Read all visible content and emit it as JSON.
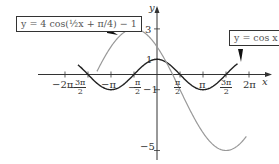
{
  "chart_data": {
    "type": "line",
    "title": "",
    "xlabel": "x",
    "ylabel": "y",
    "xlim": [
      -6.6,
      6.9
    ],
    "ylim": [
      -5.4,
      3.6
    ],
    "grid": false,
    "x_tick_labels": [
      "−2π",
      "−3π/2",
      "−π",
      "−π/2",
      "π/2",
      "π",
      "3π/2",
      "2π"
    ],
    "y_tick_labels": [
      "3",
      "1",
      "−1",
      "−5"
    ],
    "series": [
      {
        "name": "y = cos x",
        "expr": "cos(x)",
        "color": "#222222",
        "label": "y = cos x"
      },
      {
        "name": "y = 4 cos(1/2 x + π/4) − 1",
        "expr": "4*cos(x/2 + pi/4) - 1",
        "color": "#999999",
        "label": "y = 4 cos(½x + π/4) − 1"
      }
    ],
    "annotations": [
      {
        "text": "y = 4 cos(½x + π/4) − 1",
        "position": "upper-left box with pointer"
      },
      {
        "text": "y = cos x",
        "position": "upper-right box with pointer"
      }
    ]
  },
  "axes": {
    "x_label": "x",
    "y_label": "y"
  },
  "ticks": {
    "x": [
      {
        "label": "−2π",
        "value": -6.2832
      },
      {
        "num": "3π",
        "den": "2",
        "sign": "−",
        "value": -4.7124
      },
      {
        "label": "−π",
        "value": -3.1416
      },
      {
        "num": "π",
        "den": "2",
        "sign": "−",
        "value": -1.5708
      },
      {
        "num": "π",
        "den": "2",
        "sign": "",
        "value": 1.5708
      },
      {
        "label": "π",
        "value": 3.1416
      },
      {
        "num": "3π",
        "den": "2",
        "sign": "",
        "value": 4.7124
      },
      {
        "label": "2π",
        "value": 6.2832
      }
    ],
    "y": [
      {
        "label": "3",
        "value": 3
      },
      {
        "label": "1",
        "value": 1
      },
      {
        "label": "−1",
        "value": -1
      },
      {
        "label": "−5",
        "value": -5
      }
    ]
  },
  "callouts": {
    "shifted": "y = 4 cos(½x + π/4) − 1",
    "cos": "y = cos x"
  }
}
